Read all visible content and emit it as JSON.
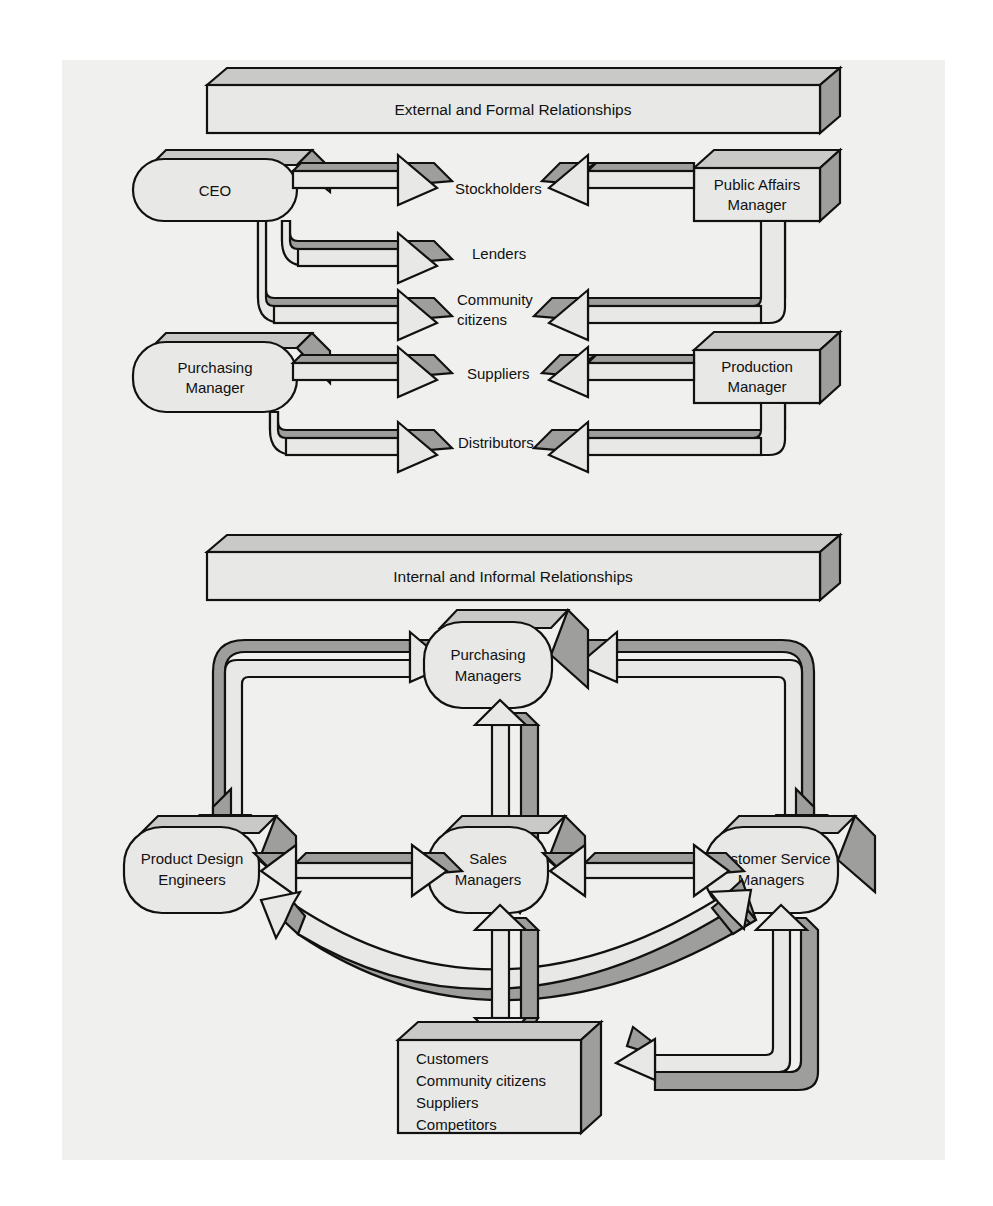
{
  "figure": {
    "title_top_band": "External and Formal Relationships",
    "title_bottom_band": "Internal and Informal Relationships"
  },
  "colors": {
    "page_background": "#f0f0ee",
    "shape_fill_light": "#e8e8e6",
    "shape_fill_shadow": "#9e9e9c",
    "shape_fill_mid": "#c8c8c6",
    "outline": "#111111",
    "text": "#111111"
  },
  "top_section": {
    "band_label": "External and Formal Relationships",
    "left_nodes": [
      {
        "id": "ceo",
        "label": "CEO",
        "shape": "rounded-capsule"
      },
      {
        "id": "purchasing-manager",
        "label_line1": "Purchasing",
        "label_line2": "Manager",
        "shape": "rounded-capsule"
      }
    ],
    "center_labels": [
      {
        "id": "stockholders",
        "line1": "Stockholders",
        "line2": ""
      },
      {
        "id": "lenders",
        "line1": "Lenders",
        "line2": ""
      },
      {
        "id": "community-citizens",
        "line1": "Community",
        "line2": "citizens"
      },
      {
        "id": "suppliers",
        "line1": "Suppliers",
        "line2": ""
      },
      {
        "id": "distributors",
        "line1": "Distributors",
        "line2": ""
      }
    ],
    "right_nodes": [
      {
        "id": "public-affairs-manager",
        "label_line1": "Public Affairs",
        "label_line2": "Manager",
        "shape": "box-3d"
      },
      {
        "id": "production-manager",
        "label_line1": "Production",
        "label_line2": "Manager",
        "shape": "box-3d"
      }
    ],
    "flows": [
      {
        "from": "ceo",
        "to": "stockholders",
        "direction": "right"
      },
      {
        "from": "ceo",
        "to": "lenders",
        "direction": "right"
      },
      {
        "from": "ceo",
        "to": "community-citizens",
        "direction": "right"
      },
      {
        "from": "purchasing-manager",
        "to": "suppliers",
        "direction": "right"
      },
      {
        "from": "purchasing-manager",
        "to": "distributors",
        "direction": "right"
      },
      {
        "from": "public-affairs-manager",
        "to": "stockholders",
        "direction": "left"
      },
      {
        "from": "public-affairs-manager",
        "to": "community-citizens",
        "direction": "left"
      },
      {
        "from": "production-manager",
        "to": "suppliers",
        "direction": "left"
      },
      {
        "from": "production-manager",
        "to": "distributors",
        "direction": "left"
      }
    ]
  },
  "bottom_section": {
    "band_label": "Internal and Informal Relationships",
    "nodes": [
      {
        "id": "purchasing-managers",
        "label_line1": "Purchasing",
        "label_line2": "Managers",
        "shape": "rounded-capsule"
      },
      {
        "id": "product-design-engineers",
        "label_line1": "Product Design",
        "label_line2": "Engineers",
        "shape": "rounded-capsule"
      },
      {
        "id": "sales-managers",
        "label_line1": "Sales",
        "label_line2": "Managers",
        "shape": "rounded-capsule"
      },
      {
        "id": "customer-service-managers",
        "label_line1": "Customer Service",
        "label_line2": "Managers",
        "shape": "rounded-capsule"
      },
      {
        "id": "stakeholders-box",
        "shape": "box-3d",
        "lines": [
          "Customers",
          "Community citizens",
          "Suppliers",
          "Competitors"
        ]
      }
    ],
    "flows": [
      {
        "from": "product-design-engineers",
        "to": "purchasing-managers",
        "style": "elbow"
      },
      {
        "from": "customer-service-managers",
        "to": "purchasing-managers",
        "style": "elbow"
      },
      {
        "from": "purchasing-managers",
        "to": "sales-managers",
        "style": "vertical-double"
      },
      {
        "from": "product-design-engineers",
        "to": "sales-managers",
        "style": "horizontal-double"
      },
      {
        "from": "sales-managers",
        "to": "customer-service-managers",
        "style": "horizontal-double"
      },
      {
        "from": "customer-service-managers",
        "to": "product-design-engineers",
        "style": "arc"
      },
      {
        "from": "sales-managers",
        "to": "stakeholders-box",
        "style": "vertical-double"
      },
      {
        "from": "customer-service-managers",
        "to": "stakeholders-box",
        "style": "elbow"
      }
    ]
  }
}
